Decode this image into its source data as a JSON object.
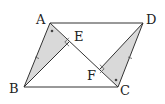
{
  "diagram": {
    "type": "geometry",
    "colors": {
      "stroke": "#333333",
      "fill": "#d9d9d9",
      "background": "#ffffff"
    },
    "points": {
      "A": {
        "x": 50,
        "y": 23
      },
      "B": {
        "x": 24,
        "y": 87
      },
      "C": {
        "x": 118,
        "y": 87
      },
      "D": {
        "x": 143,
        "y": 23
      },
      "E": {
        "x": 69,
        "y": 42
      },
      "F": {
        "x": 100,
        "y": 69
      }
    },
    "labels": {
      "A": "A",
      "B": "B",
      "C": "C",
      "D": "D",
      "E": "E",
      "F": "F"
    },
    "segments": [
      "AB",
      "BC",
      "CD",
      "DA",
      "AC",
      "BE",
      "DF"
    ],
    "shaded_triangles": [
      "ABE",
      "CDF"
    ],
    "right_angles": [
      "E",
      "F"
    ],
    "angle_marks": [
      "BAE",
      "DCF"
    ],
    "equal_side_ticks": [
      "AB",
      "CD"
    ]
  }
}
